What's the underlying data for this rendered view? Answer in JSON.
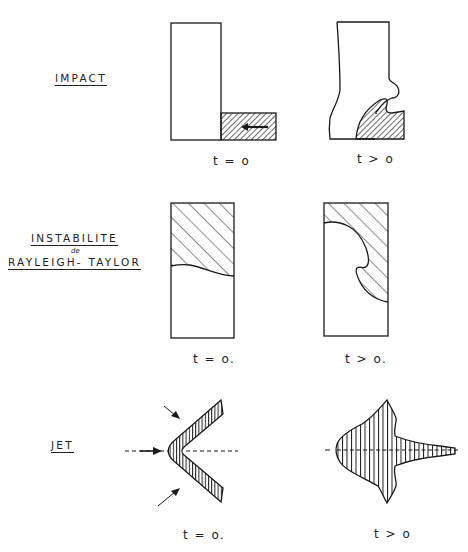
{
  "diagram": {
    "rows": [
      {
        "id": "impact",
        "label": "IMPACT",
        "panels": [
          {
            "time_label": "t = o",
            "state": "initial"
          },
          {
            "time_label": "t > o",
            "state": "evolved"
          }
        ]
      },
      {
        "id": "rayleigh-taylor",
        "label_line1": "INSTABILITE",
        "label_connector": "de",
        "label_line2": "RAYLEIGH- TAYLOR",
        "panels": [
          {
            "time_label": "t = o.",
            "state": "initial"
          },
          {
            "time_label": "t > o.",
            "state": "evolved"
          }
        ]
      },
      {
        "id": "jet",
        "label": "JET",
        "panels": [
          {
            "time_label": "t = o.",
            "state": "initial"
          },
          {
            "time_label": "t > o",
            "state": "evolved"
          }
        ]
      }
    ],
    "colors": {
      "ink": "#1a1a1a",
      "paper": "#ffffff"
    }
  }
}
